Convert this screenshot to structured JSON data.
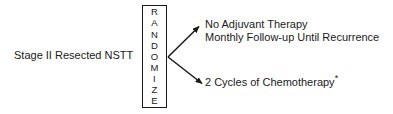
{
  "diagram": {
    "entry": {
      "label": "Stage II Resected NSTT"
    },
    "randomize_box": {
      "label": "RANDOMIZE",
      "letters": [
        "R",
        "A",
        "N",
        "D",
        "O",
        "M",
        "I",
        "Z",
        "E"
      ],
      "orientation": "vertical"
    },
    "branches": [
      {
        "id": "no-adjuvant-therapy",
        "lines": [
          "No Adjuvant Therapy",
          "Monthly Follow-up Until Recurrence"
        ],
        "arrow_direction": "up-right"
      },
      {
        "id": "chemotherapy",
        "lines": [
          "2 Cycles of Chemotherapy"
        ],
        "footnote_mark": "*",
        "arrow_direction": "down-right"
      }
    ],
    "colors": {
      "background": "#ffffff",
      "ink": "#1a1a1a"
    }
  }
}
